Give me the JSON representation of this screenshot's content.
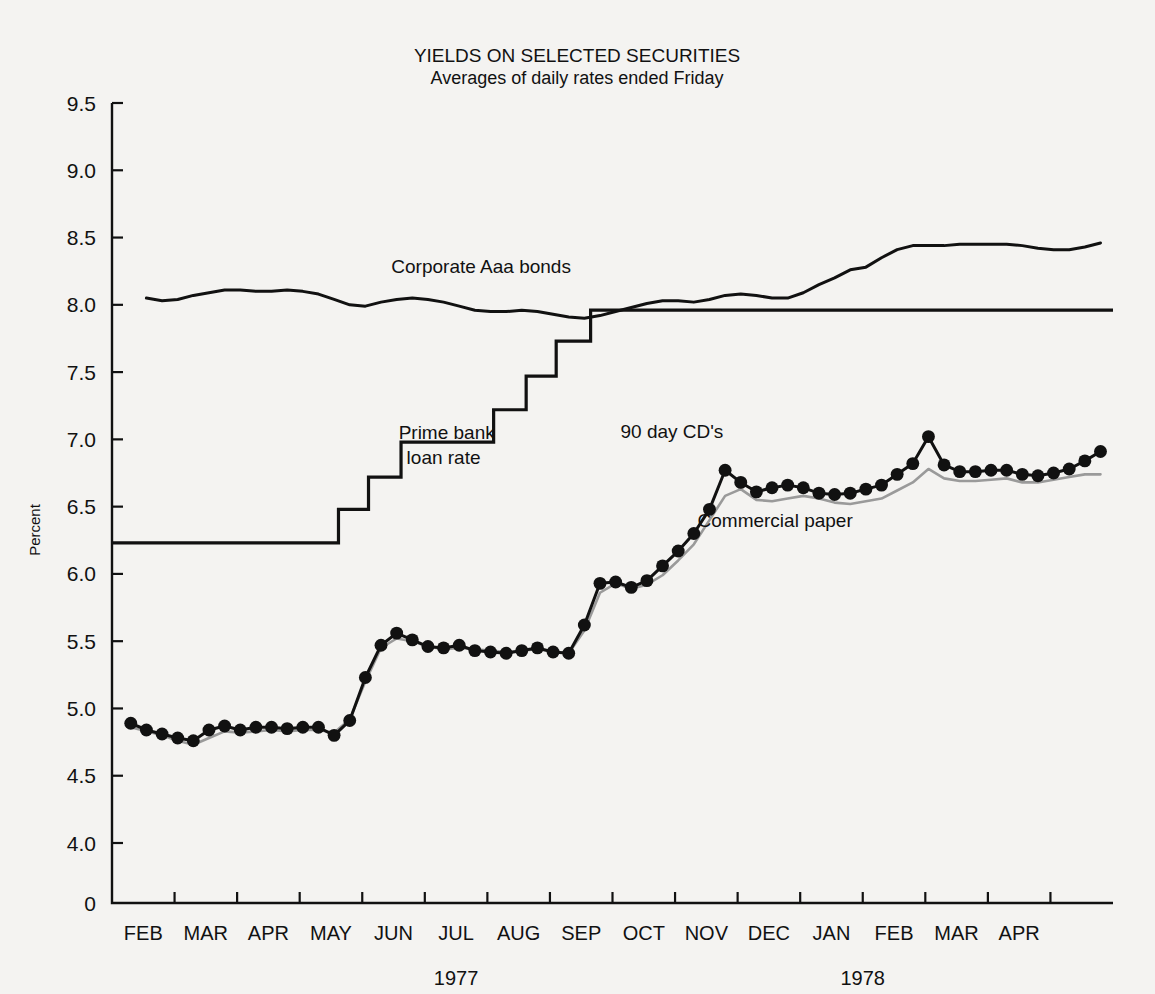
{
  "chart_data": {
    "type": "line",
    "title": "YIELDS ON SELECTED SECURITIES",
    "subtitle": "Averages of daily rates ended Friday",
    "ylabel": "Percent",
    "xlabel": "",
    "grid": false,
    "legend_position": "inline-annotations",
    "ylim": [
      3.85,
      9.5
    ],
    "yticks": [
      "9.5",
      "9.0",
      "8.5",
      "8.0",
      "7.5",
      "7.0",
      "6.5",
      "6.0",
      "5.5",
      "5.0",
      "4.5",
      "4.0",
      "0"
    ],
    "ytick_values": [
      9.5,
      9.0,
      8.5,
      8.0,
      7.5,
      7.0,
      6.5,
      6.0,
      5.5,
      5.0,
      4.5,
      4.0,
      3.85
    ],
    "axis_break_below": 4.0,
    "xticks": [
      "FEB",
      "MAR",
      "APR",
      "MAY",
      "JUN",
      "JUL",
      "AUG",
      "SEP",
      "OCT",
      "NOV",
      "DEC",
      "JAN",
      "FEB",
      "MAR",
      "APR"
    ],
    "xlim": [
      0.0,
      16.0
    ],
    "year_labels": [
      {
        "text": "1977",
        "at_month": 5.5
      },
      {
        "text": "1978",
        "at_month": 12.0
      }
    ],
    "annotations": [
      {
        "text": "Corporate Aaa bonds",
        "x": 5.9,
        "y": 8.24,
        "anchor": "middle"
      },
      {
        "text": "Prime bank",
        "x": 5.35,
        "y": 7.0,
        "anchor": "middle"
      },
      {
        "text": "loan rate",
        "x": 5.3,
        "y": 6.82,
        "anchor": "middle"
      },
      {
        "text": "90 day CD's",
        "x": 8.95,
        "y": 7.01,
        "anchor": "middle"
      },
      {
        "text": "Commercial paper",
        "x": 10.6,
        "y": 6.35,
        "anchor": "middle"
      }
    ],
    "series": [
      {
        "name": "Corporate Aaa bonds",
        "color": "#111111",
        "style": "solid",
        "markers": false,
        "width": 3.0,
        "x": [
          0.55,
          0.8,
          1.05,
          1.3,
          1.55,
          1.8,
          2.05,
          2.3,
          2.55,
          2.8,
          3.05,
          3.3,
          3.55,
          3.8,
          4.05,
          4.3,
          4.55,
          4.8,
          5.05,
          5.3,
          5.55,
          5.8,
          6.05,
          6.3,
          6.55,
          6.8,
          7.05,
          7.3,
          7.55,
          7.8,
          8.05,
          8.3,
          8.55,
          8.8,
          9.05,
          9.3,
          9.55,
          9.8,
          10.05,
          10.3,
          10.55,
          10.8,
          11.05,
          11.3,
          11.55,
          11.8,
          12.05,
          12.3,
          12.55,
          12.8,
          13.05,
          13.3,
          13.55,
          13.8,
          14.05,
          14.3,
          14.55,
          14.8,
          15.05,
          15.3,
          15.55,
          15.8
        ],
        "y": [
          8.05,
          8.03,
          8.04,
          8.07,
          8.09,
          8.11,
          8.11,
          8.1,
          8.1,
          8.11,
          8.1,
          8.08,
          8.04,
          8.0,
          7.99,
          8.02,
          8.04,
          8.05,
          8.04,
          8.02,
          7.99,
          7.96,
          7.95,
          7.95,
          7.96,
          7.95,
          7.93,
          7.91,
          7.9,
          7.92,
          7.95,
          7.98,
          8.01,
          8.03,
          8.03,
          8.02,
          8.04,
          8.07,
          8.08,
          8.07,
          8.05,
          8.05,
          8.09,
          8.15,
          8.2,
          8.26,
          8.28,
          8.35,
          8.41,
          8.44,
          8.44,
          8.44,
          8.45,
          8.45,
          8.45,
          8.45,
          8.44,
          8.42,
          8.41,
          8.41,
          8.43,
          8.46
        ]
      },
      {
        "name": "Prime bank loan rate",
        "color": "#111111",
        "style": "step",
        "markers": false,
        "width": 3.2,
        "x": [
          0.0,
          3.62,
          3.62,
          4.1,
          4.1,
          4.62,
          4.62,
          6.1,
          6.1,
          6.62,
          6.62,
          7.1,
          7.1,
          7.65,
          7.65,
          11.1,
          11.1,
          16.0
        ],
        "y": [
          6.23,
          6.23,
          6.48,
          6.48,
          6.72,
          6.72,
          6.98,
          6.98,
          7.22,
          7.22,
          7.47,
          7.47,
          7.73,
          7.73,
          7.96,
          7.96,
          7.96,
          7.96
        ],
        "step_levels": [
          6.23,
          6.48,
          6.72,
          6.98,
          7.22,
          7.47,
          7.73,
          7.96
        ]
      },
      {
        "name": "Commercial paper",
        "color": "#9a9a9a",
        "style": "solid",
        "markers": false,
        "width": 2.6,
        "x": [
          0.3,
          0.55,
          0.8,
          1.05,
          1.3,
          1.55,
          1.8,
          2.05,
          2.3,
          2.55,
          2.8,
          3.05,
          3.3,
          3.55,
          3.8,
          4.05,
          4.3,
          4.55,
          4.8,
          5.05,
          5.3,
          5.55,
          5.8,
          6.05,
          6.3,
          6.55,
          6.8,
          7.05,
          7.3,
          7.55,
          7.8,
          8.05,
          8.3,
          8.55,
          8.8,
          9.05,
          9.3,
          9.55,
          9.8,
          10.05,
          10.3,
          10.55,
          10.8,
          11.05,
          11.3,
          11.55,
          11.8,
          12.05,
          12.3,
          12.55,
          12.8,
          13.05,
          13.3,
          13.55,
          13.8,
          14.05,
          14.3,
          14.55,
          14.8,
          15.05,
          15.3,
          15.55,
          15.8
        ],
        "y": [
          4.86,
          4.83,
          4.8,
          4.76,
          4.73,
          4.78,
          4.83,
          4.82,
          4.83,
          4.84,
          4.83,
          4.84,
          4.84,
          4.82,
          4.92,
          5.2,
          5.45,
          5.52,
          5.5,
          5.46,
          5.44,
          5.45,
          5.44,
          5.43,
          5.42,
          5.43,
          5.44,
          5.42,
          5.41,
          5.58,
          5.86,
          5.93,
          5.89,
          5.92,
          5.99,
          6.1,
          6.22,
          6.4,
          6.58,
          6.63,
          6.55,
          6.54,
          6.56,
          6.58,
          6.56,
          6.53,
          6.52,
          6.54,
          6.56,
          6.62,
          6.68,
          6.78,
          6.71,
          6.69,
          6.69,
          6.7,
          6.71,
          6.68,
          6.68,
          6.7,
          6.72,
          6.74,
          6.74
        ]
      },
      {
        "name": "90 day CD's",
        "color": "#111111",
        "style": "solid",
        "markers": true,
        "width": 3.0,
        "marker_size": 8.5,
        "x": [
          0.3,
          0.55,
          0.8,
          1.05,
          1.3,
          1.55,
          1.8,
          2.05,
          2.3,
          2.55,
          2.8,
          3.05,
          3.3,
          3.55,
          3.8,
          4.05,
          4.3,
          4.55,
          4.8,
          5.05,
          5.3,
          5.55,
          5.8,
          6.05,
          6.3,
          6.55,
          6.8,
          7.05,
          7.3,
          7.55,
          7.8,
          8.05,
          8.3,
          8.55,
          8.8,
          9.05,
          9.3,
          9.55,
          9.8,
          10.05,
          10.3,
          10.55,
          10.8,
          11.05,
          11.3,
          11.55,
          11.8,
          12.05,
          12.3,
          12.55,
          12.8,
          13.05,
          13.3,
          13.55,
          13.8,
          14.05,
          14.3,
          14.55,
          14.8,
          15.05,
          15.3,
          15.55,
          15.8
        ],
        "y": [
          4.89,
          4.84,
          4.81,
          4.78,
          4.76,
          4.84,
          4.87,
          4.84,
          4.86,
          4.86,
          4.85,
          4.86,
          4.86,
          4.8,
          4.91,
          5.23,
          5.47,
          5.56,
          5.51,
          5.46,
          5.45,
          5.47,
          5.43,
          5.42,
          5.41,
          5.43,
          5.45,
          5.42,
          5.41,
          5.62,
          5.93,
          5.94,
          5.9,
          5.95,
          6.06,
          6.17,
          6.3,
          6.48,
          6.77,
          6.68,
          6.61,
          6.64,
          6.66,
          6.64,
          6.6,
          6.59,
          6.6,
          6.63,
          6.66,
          6.74,
          6.82,
          7.02,
          6.81,
          6.76,
          6.76,
          6.77,
          6.77,
          6.74,
          6.73,
          6.75,
          6.78,
          6.84,
          6.91
        ]
      }
    ]
  },
  "colors": {
    "background": "#f4f3f1",
    "ink": "#111111",
    "commercial_paper": "#9a9a9a"
  }
}
